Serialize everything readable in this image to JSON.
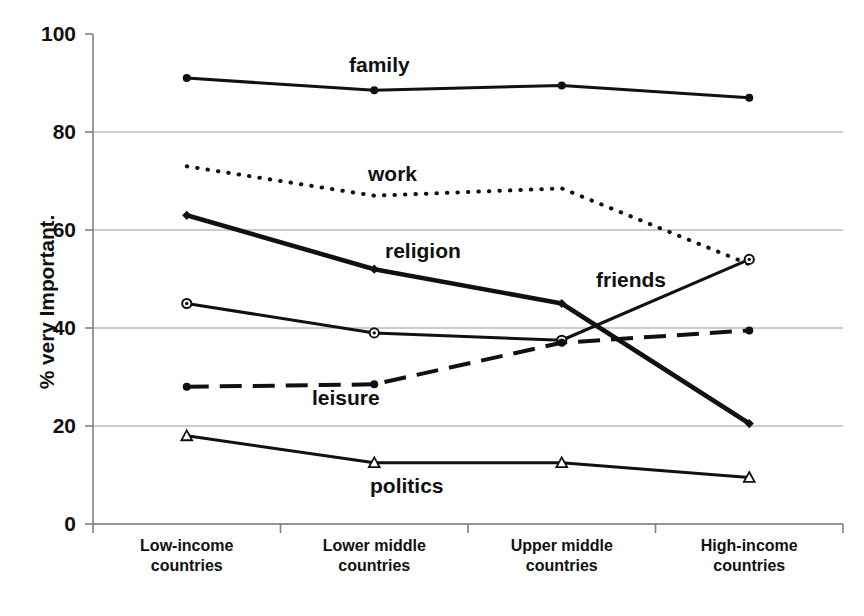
{
  "chart_data": {
    "type": "line",
    "title": "",
    "subtitle": "",
    "xlabel": "",
    "ylabel": "% very Important.",
    "ylim": [
      0,
      100
    ],
    "ytick_labels": [
      "100",
      "80",
      "60",
      "40",
      "20",
      "0"
    ],
    "ytick_values": [
      100,
      80,
      60,
      40,
      20,
      0
    ],
    "grid": true,
    "grid_axis": "y",
    "legend": "inline-labels",
    "categories": [
      "Low-income countries",
      "Lower middle countries",
      "Upper middle countries",
      "High-income countries"
    ],
    "category_lines": [
      [
        "Low-income",
        "countries"
      ],
      [
        "Lower middle",
        "countries"
      ],
      [
        "Upper middle",
        "countries"
      ],
      [
        "High-income",
        "countries"
      ]
    ],
    "series": [
      {
        "name": "family",
        "label": "family",
        "values": [
          91,
          88.5,
          89.5,
          87
        ],
        "style": "solid",
        "marker": "dot",
        "color": "#111111"
      },
      {
        "name": "work",
        "label": "work",
        "values": [
          73,
          67,
          68.5,
          53
        ],
        "style": "dotted",
        "marker": "none",
        "color": "#111111"
      },
      {
        "name": "religion",
        "label": "religion",
        "values": [
          63,
          52,
          45,
          20.5
        ],
        "style": "solid-thick",
        "marker": "diamond",
        "color": "#111111"
      },
      {
        "name": "friends",
        "label": "friends",
        "values": [
          45,
          39,
          37.5,
          54
        ],
        "style": "solid",
        "marker": "open-circle",
        "color": "#111111"
      },
      {
        "name": "leisure",
        "label": "leisure",
        "values": [
          28,
          28.5,
          37,
          39.5
        ],
        "style": "dashed",
        "marker": "dot",
        "color": "#111111"
      },
      {
        "name": "politics",
        "label": "politics",
        "values": [
          18,
          12.5,
          12.5,
          9.5
        ],
        "style": "solid",
        "marker": "open-triangle",
        "color": "#111111"
      }
    ],
    "series_label_positions": [
      {
        "name": "family",
        "x": 349,
        "y": 54
      },
      {
        "name": "work",
        "x": 368,
        "y": 163
      },
      {
        "name": "religion",
        "x": 385,
        "y": 240
      },
      {
        "name": "friends",
        "x": 596,
        "y": 269
      },
      {
        "name": "leisure",
        "x": 312,
        "y": 387
      },
      {
        "name": "politics",
        "x": 370,
        "y": 475
      }
    ],
    "axis_color": "#808080",
    "grid_color": "#9a9a9a",
    "plot_box": {
      "left": 93,
      "right": 843,
      "top": 34,
      "bottom": 524
    }
  }
}
